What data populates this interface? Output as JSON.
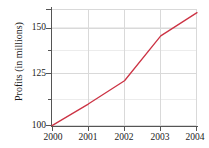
{
  "chart_data": {
    "type": "line",
    "title": "",
    "xlabel": "",
    "ylabel": "Profits (in millions)",
    "categories": [
      "2000",
      "2001",
      "2002",
      "2003",
      "2004"
    ],
    "x": [
      2000,
      2001,
      2002,
      2003,
      2004
    ],
    "values": [
      100,
      112,
      125,
      150,
      163
    ],
    "series": [
      {
        "name": "Profits",
        "values": [
          100,
          112,
          125,
          150,
          163
        ],
        "color": "#cc3344"
      }
    ],
    "xlim": [
      2000,
      2004
    ],
    "ylim": [
      100,
      165
    ],
    "y_major_ticks": [
      100,
      125,
      150
    ],
    "y_major_tick_labels": [
      "100",
      "125",
      "150"
    ],
    "y_minor_ticks": [
      112.5,
      137.5,
      162.5
    ],
    "x_ticks": [
      2000,
      2001,
      2002,
      2003,
      2004
    ],
    "x_tick_labels": [
      "2000",
      "2001",
      "2002",
      "2003",
      "2004"
    ],
    "grid": true,
    "grid_color": "#d9d9d9",
    "legend": false,
    "legend_position": "none",
    "axis_color": "#555555",
    "background": "#ffffff"
  },
  "axes": {
    "y_title": "Profits (in millions)",
    "y_labels": [
      "150",
      "125",
      "100"
    ],
    "x_labels": [
      "2000",
      "2001",
      "2002",
      "2003",
      "2004"
    ]
  }
}
